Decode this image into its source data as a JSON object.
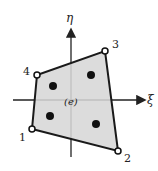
{
  "diagram": {
    "element_label": "(e)",
    "axes": {
      "vertical": "η",
      "horizontal": "ξ"
    },
    "nodes": [
      {
        "label": "1",
        "x": 32,
        "y": 129
      },
      {
        "label": "2",
        "x": 118,
        "y": 151
      },
      {
        "label": "3",
        "x": 105,
        "y": 51
      },
      {
        "label": "4",
        "x": 37,
        "y": 75
      }
    ],
    "gauss_points": [
      {
        "x": 91,
        "y": 75
      },
      {
        "x": 53,
        "y": 86
      },
      {
        "x": 50,
        "y": 116
      },
      {
        "x": 96,
        "y": 124
      }
    ],
    "colors": {
      "fill": "#dcdcdc",
      "stroke": "#1a1a1a"
    }
  }
}
